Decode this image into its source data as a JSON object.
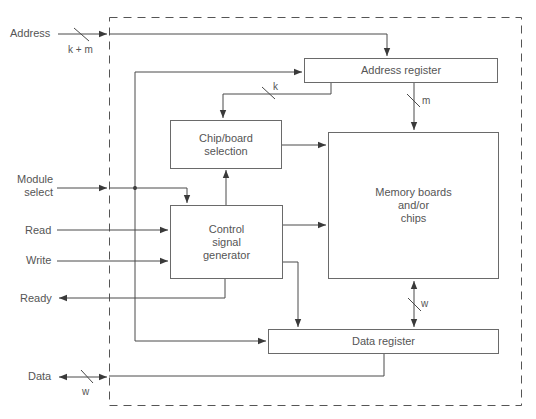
{
  "diagram": {
    "blocks": {
      "address_register": "Address register",
      "chip_selection": "Chip/board\nselection",
      "memory": "Memory boards\nand/or\nchips",
      "control_generator": "Control\nsignal\ngenerator",
      "data_register": "Data register"
    },
    "inputs": {
      "address": "Address",
      "module_select": "Module\nselect",
      "read": "Read",
      "write": "Write",
      "ready": "Ready",
      "data": "Data"
    },
    "bus_widths": {
      "address_bus": "k + m",
      "chip_select_bus": "k",
      "memory_address_bus": "m",
      "memory_data_bus": "w",
      "external_data_bus": "w"
    },
    "colors": {
      "line": "#4a4a4a",
      "text": "#555555",
      "border": "#6a6a6a"
    }
  }
}
